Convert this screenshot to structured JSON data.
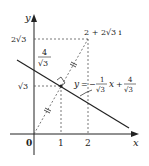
{
  "diagram": {
    "axes": {
      "x_label": "x",
      "y_label": "y",
      "origin_label": "0",
      "x_ticks": [
        "1",
        "2"
      ],
      "y_ticks": [
        "√3",
        "2√3"
      ]
    },
    "point_label": "2 + 2√3 i",
    "intercept_label": {
      "numerator": "4",
      "denominator": "√3"
    },
    "line_equation": {
      "lhs": "y",
      "eq": "=",
      "minus": "−",
      "coef_num": "1",
      "coef_den": "√3",
      "var": "x",
      "plus": "+",
      "const_num": "4",
      "const_den": "√3"
    },
    "colors": {
      "axis": "#222222",
      "line": "#222222",
      "dashed": "#555555"
    }
  }
}
